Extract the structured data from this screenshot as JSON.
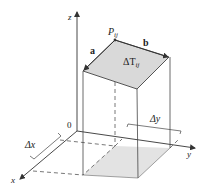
{
  "diagram": {
    "type": "3d-surface-patch-tangent-plane",
    "labels": {
      "z_axis": "z",
      "x_axis": "x",
      "y_axis": "y",
      "origin": "0",
      "point_main": "P",
      "point_sub": "ij",
      "vector_a": "a",
      "vector_b": "b",
      "area_main": "ΔT",
      "area_sub": "ij",
      "delta_x": "Δx",
      "delta_y": "Δy"
    },
    "colors": {
      "line": "#444444",
      "patch_fill": "#d9d9d9",
      "shadow_fill": "#e3e3e3",
      "text": "#222222"
    }
  }
}
